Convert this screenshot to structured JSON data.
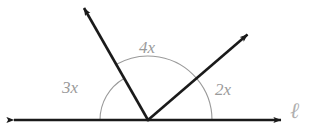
{
  "figure": {
    "type": "geometry-diagram",
    "background_color": "#ffffff",
    "stroke_color": "#1a1a1a",
    "arc_color": "#9a9a9a",
    "label_color": "#9a9a9a",
    "line_label_color": "#b0b0b0",
    "vertex": {
      "x": 148,
      "y": 120
    },
    "baseline": {
      "name": "line-l",
      "label": "ℓ",
      "from": {
        "x": 12,
        "y": 120
      },
      "to": {
        "x": 283,
        "y": 120
      },
      "arrow_start": true,
      "arrow_end": true
    },
    "rays": [
      {
        "name": "ray-upper-left",
        "from": {
          "x": 148,
          "y": 120
        },
        "to": {
          "x": 82,
          "y": 5
        },
        "angle_degrees": 120,
        "arrow_end": true
      },
      {
        "name": "ray-upper-right",
        "from": {
          "x": 148,
          "y": 120
        },
        "to": {
          "x": 250,
          "y": 32
        },
        "angle_degrees": 40,
        "arrow_end": true
      }
    ],
    "angles": [
      {
        "name": "angle-3x",
        "label": "3x",
        "radius": 48,
        "start_degrees": 120,
        "end_degrees": 180,
        "label_position": {
          "x": 62,
          "y": 79
        }
      },
      {
        "name": "angle-4x",
        "label": "4x",
        "radius": 64,
        "start_degrees": 40,
        "end_degrees": 120,
        "label_position": {
          "x": 139,
          "y": 39
        }
      },
      {
        "name": "angle-2x",
        "label": "2x",
        "radius": 64,
        "start_degrees": 0,
        "end_degrees": 40,
        "label_position": {
          "x": 215,
          "y": 81
        }
      }
    ]
  }
}
